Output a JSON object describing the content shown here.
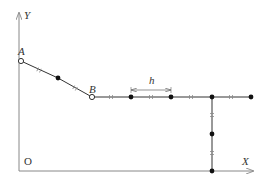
{
  "diagram": {
    "axes": {
      "x_label": "X",
      "y_label": "Y",
      "origin_label": "O"
    },
    "points": {
      "A": {
        "label": "A",
        "type": "open"
      },
      "B": {
        "label": "B",
        "type": "open"
      }
    },
    "dimension": {
      "label": "h"
    },
    "colors": {
      "axis": "#888888",
      "line": "#333333",
      "node_fill": "#111111",
      "open_node_fill": "#ffffff",
      "tick": "#888888"
    }
  }
}
